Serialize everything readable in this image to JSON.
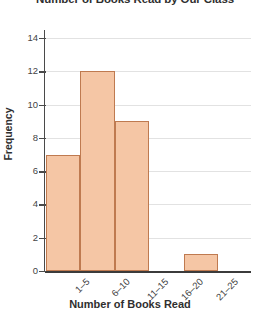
{
  "chart_data": {
    "type": "bar",
    "title": "Number of Books Read by Our Class",
    "xlabel": "Number of Books Read",
    "ylabel": "Frequency",
    "categories": [
      "1–5",
      "6–10",
      "11–15",
      "16–20",
      "21–25"
    ],
    "values": [
      7,
      12,
      9,
      0,
      1
    ],
    "ylim": [
      0,
      15
    ],
    "yticks": [
      0,
      2,
      4,
      6,
      8,
      10,
      12,
      14
    ],
    "ytick_labels": [
      "0",
      "2",
      "4",
      "6",
      "8",
      "10",
      "12",
      "14"
    ],
    "grid": "horizontal",
    "legend": "none",
    "bar_fill_color": "#f5c6a5",
    "bar_edge_color": "#bf7a50",
    "gridline_color": "#e2e2e2",
    "axis_color": "#3b3b3b",
    "text_color": "#2f2f2f"
  }
}
